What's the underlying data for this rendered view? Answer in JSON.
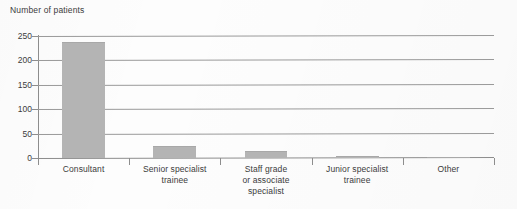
{
  "chart_data": {
    "type": "bar",
    "title": "Number of patients",
    "xlabel": "",
    "ylabel": "Number of patients",
    "categories": [
      "Consultant",
      "Senior specialist trainee",
      "Staff grade or associate specialist",
      "Junior specialist trainee",
      "Other"
    ],
    "category_lines": [
      [
        "Consultant"
      ],
      [
        "Senior specialist",
        "trainee"
      ],
      [
        "Staff grade",
        "or associate",
        "specialist"
      ],
      [
        "Junior specialist",
        "trainee"
      ],
      [
        "Other"
      ]
    ],
    "values": [
      238,
      24,
      14,
      5,
      3
    ],
    "ylim": [
      0,
      250
    ],
    "yticks": [
      0,
      50,
      100,
      150,
      200,
      250
    ],
    "ytick_labels": [
      "0",
      "50",
      "100",
      "150",
      "200",
      "250"
    ],
    "grid": true,
    "legend": false,
    "bar_color": "#b4b4b4",
    "grid_color": "#9a9a9a",
    "axis_color": "#8d8d8d",
    "text_color": "#3b3b3b",
    "background": "#fdfdfd"
  }
}
